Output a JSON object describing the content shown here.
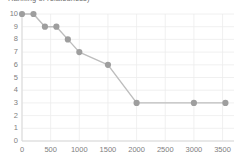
{
  "chart_data": {
    "type": "line",
    "title": "Ranking of relatedness)",
    "xlabel": "",
    "ylabel": "",
    "x": [
      0,
      200,
      400,
      600,
      800,
      1000,
      1500,
      2000,
      3000,
      3550
    ],
    "values": [
      10,
      10,
      9,
      9,
      8,
      7,
      6,
      3,
      3,
      3
    ],
    "series": [
      {
        "name": "ranking",
        "x": [
          0,
          200,
          400,
          600,
          800,
          1000,
          1500,
          2000,
          3000,
          3550
        ],
        "values": [
          10,
          10,
          9,
          9,
          8,
          7,
          6,
          3,
          3,
          3
        ]
      }
    ],
    "xlim": [
      0,
      3700
    ],
    "ylim": [
      0,
      10
    ],
    "xticks": [
      0,
      500,
      1000,
      1500,
      2000,
      2500,
      3000,
      3500
    ],
    "xtick_labels": [
      "0",
      "500",
      "1000",
      "1500",
      "2000",
      "2500",
      "3000",
      "3500"
    ],
    "yticks": [
      0,
      1,
      2,
      3,
      4,
      5,
      6,
      7,
      8,
      9,
      10
    ],
    "ytick_labels": [
      "0",
      "1",
      "2",
      "3",
      "4",
      "5",
      "6",
      "7",
      "8",
      "9",
      "10"
    ],
    "grid": true,
    "legend": false,
    "legend_position": "none",
    "marker": "circle",
    "colors": {
      "line": "#bdbdbd",
      "marker": "#9e9e9e",
      "grid": "#ececec",
      "axis": "#d9d9d9",
      "tick_text": "#808080",
      "background": "#ffffff"
    }
  }
}
